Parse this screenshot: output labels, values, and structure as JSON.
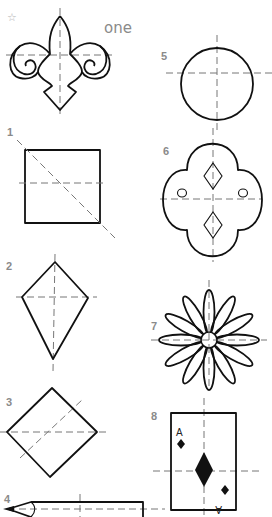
{
  "worksheet": {
    "header_word": "one",
    "star_glyph": "☆",
    "items": [
      {
        "number": "1",
        "shape": "square",
        "lines_of_symmetry_shown": 2
      },
      {
        "number": "2",
        "shape": "kite",
        "lines_of_symmetry_shown": 2
      },
      {
        "number": "3",
        "shape": "diamond (rotated square)",
        "lines_of_symmetry_shown": 2
      },
      {
        "number": "4",
        "shape": "pencil",
        "lines_of_symmetry_shown": 2
      },
      {
        "number": "5",
        "shape": "circle",
        "lines_of_symmetry_shown": 2
      },
      {
        "number": "6",
        "shape": "four-lobed tile with diamonds and dots",
        "lines_of_symmetry_shown": 2
      },
      {
        "number": "7",
        "shape": "daisy flower",
        "lines_of_symmetry_shown": 2
      },
      {
        "number": "8",
        "shape": "ace of diamonds playing card",
        "lines_of_symmetry_shown": 2
      }
    ],
    "example_shape": "fleur-de-lis",
    "card": {
      "corner_top": "A",
      "corner_bottom": "A"
    }
  }
}
